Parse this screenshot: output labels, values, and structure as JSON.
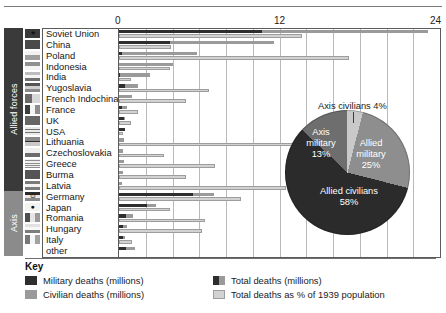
{
  "figure": {
    "axis": {
      "ticks": [
        "0",
        "12",
        "24"
      ],
      "min": 0,
      "max": 24,
      "gridline_step": 2
    },
    "group_bands": [
      {
        "label": "Allied forces",
        "color": "#3a3a3a"
      },
      {
        "label": "Axis",
        "color": "#8b8b8b"
      }
    ],
    "key": {
      "title": "Key",
      "items": [
        {
          "label": "Military deaths (millions)",
          "swatch": "solid",
          "color": "#2e2e2e"
        },
        {
          "label": "Total deaths (millions)",
          "swatch": "split",
          "color": "#2e2e2e",
          "color2": "#9a9a9a"
        },
        {
          "label": "Civilian deaths (millions)",
          "swatch": "solid",
          "color": "#9a9a9a"
        },
        {
          "label": "Total deaths as % of 1939 population",
          "swatch": "outline",
          "color": "#d2d2d2"
        }
      ]
    }
  },
  "chart_data": [
    {
      "type": "bar",
      "title": "",
      "xlabel": "",
      "ylabel": "",
      "xlim": [
        0,
        24
      ],
      "orientation": "horizontal",
      "grid": true,
      "categories": [
        "Soviet Union",
        "China",
        "Poland",
        "Indonesia",
        "India",
        "Yugoslavia",
        "French Indochina",
        "France",
        "UK",
        "USA",
        "Lithuania",
        "Czechoslovakia",
        "Greece",
        "Burma",
        "Latvia",
        "Germany",
        "Japan",
        "Romania",
        "Hungary",
        "Italy",
        "other"
      ],
      "alliance": [
        "Allied",
        "Allied",
        "Allied",
        "Allied",
        "Allied",
        "Allied",
        "Allied",
        "Allied",
        "Allied",
        "Allied",
        "Allied",
        "Allied",
        "Allied",
        "Allied",
        "Allied",
        "Axis",
        "Axis",
        "Axis",
        "Axis",
        "Axis",
        "Axis"
      ],
      "series": [
        {
          "name": "Military deaths (millions)",
          "values": [
            10.7,
            3.8,
            0.24,
            0.0,
            0.09,
            0.45,
            0.0,
            0.22,
            0.38,
            0.42,
            0.0,
            0.025,
            0.02,
            0.03,
            0.0,
            5.5,
            2.1,
            0.55,
            0.3,
            0.3,
            0.5
          ]
        },
        {
          "name": "Civilian deaths (millions)",
          "values": [
            12.4,
            7.8,
            5.6,
            4.0,
            2.2,
            1.0,
            1.0,
            0.35,
            0.07,
            0.0,
            0.35,
            0.3,
            0.35,
            0.25,
            0.23,
            1.6,
            0.65,
            0.5,
            0.3,
            0.15,
            0.7
          ]
        },
        {
          "name": "Total deaths as % of 1939 population",
          "values": [
            13.7,
            3.9,
            17.2,
            3.8,
            0.9,
            6.7,
            5.0,
            1.4,
            0.9,
            0.3,
            14.4,
            3.4,
            7.2,
            5.0,
            12.5,
            9.1,
            3.8,
            6.4,
            6.2,
            1.0,
            0.0
          ]
        }
      ]
    },
    {
      "type": "pie",
      "title": "",
      "labels": [
        "Allied military",
        "Allied civilians",
        "Axis military",
        "Axis civilians"
      ],
      "values": [
        25,
        58,
        13,
        4
      ],
      "unit": "%",
      "slices": [
        {
          "label": "Allied military",
          "value": 25,
          "text": "Allied\nmilitary\n25%",
          "color": "#8e8e8e",
          "callout": false
        },
        {
          "label": "Allied civilians",
          "value": 58,
          "text": "Allied civilians\n58%",
          "color": "#2b2b2b",
          "callout": false
        },
        {
          "label": "Axis military",
          "value": 13,
          "text": "Axis\nmilitary\n13%",
          "color": "#6e6e6e",
          "callout": false
        },
        {
          "label": "Axis civilians",
          "value": 4,
          "text": "Axis civilians 4%",
          "color": "#c9c9c9",
          "callout": true
        }
      ]
    }
  ],
  "pie_text": {
    "allied_military": "Allied\nmilitary\n25%",
    "allied_military_l1": "Allied",
    "allied_military_l2": "military",
    "allied_military_l3": "25%",
    "allied_civilians_l1": "Allied civilians",
    "allied_civilians_l2": "58%",
    "axis_military_l1": "Axis",
    "axis_military_l2": "military",
    "axis_military_l3": "13%",
    "axis_civilians_callout": "Axis civilians 4%"
  }
}
